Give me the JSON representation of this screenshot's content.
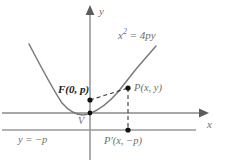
{
  "figure": {
    "colors": {
      "curve": "#7a7a7a",
      "axis": "#8a8a8a",
      "directrix": "#9a9a9a",
      "dashed": "#3a3a3a",
      "point": "#111111",
      "label": "#6e6e6e",
      "label_dark": "#1a1a1a",
      "background": "#ffffff"
    },
    "equation": {
      "base": "x",
      "exponent": "2",
      "rest": " = 4py"
    },
    "axes": {
      "x_label": "x",
      "y_label": "y"
    },
    "points": [
      {
        "name": "focus",
        "label": "F(0, p)"
      },
      {
        "name": "point-p",
        "label": "P(x, y)"
      },
      {
        "name": "point-p-prime",
        "label": "P′(x, −p)"
      },
      {
        "name": "vertex",
        "label": "V"
      }
    ],
    "directrix_label": "y = −p",
    "geometry": {
      "origin_x": 90,
      "origin_y": 113,
      "focus_y": 100,
      "directrix_y": 130,
      "p_x": 128,
      "p_y": 88
    }
  }
}
